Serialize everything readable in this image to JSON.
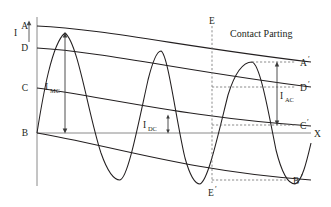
{
  "figure": {
    "title_annotation": "Contact Parting",
    "axes": {
      "y_axis_label": "I",
      "x_axis_label": "X"
    },
    "envelope_labels": {
      "upper_start": "A",
      "upper_end": "A",
      "upper_end_prime": "′",
      "mid_upper_start": "D",
      "mid_upper_end": "D",
      "mid_upper_end_prime": "′",
      "dc_start": "C",
      "dc_end": "C",
      "dc_end_prime": "′",
      "lower_start": "B",
      "lower_end": "B",
      "lower_end_prime": "′"
    },
    "vertical_marker": {
      "top": "E",
      "bottom": "E",
      "bottom_prime": "′"
    },
    "measurements": [
      {
        "id": "momentary-current",
        "symbol": "I",
        "subscript": "MC"
      },
      {
        "id": "dc-component",
        "symbol": "I",
        "subscript": "DC"
      },
      {
        "id": "ac-component",
        "symbol": "I",
        "subscript": "AC"
      }
    ],
    "colors": {
      "curve": "#231f20",
      "axis": "#808080",
      "dashed": "#6e6e6e",
      "text": "#231f20"
    }
  }
}
